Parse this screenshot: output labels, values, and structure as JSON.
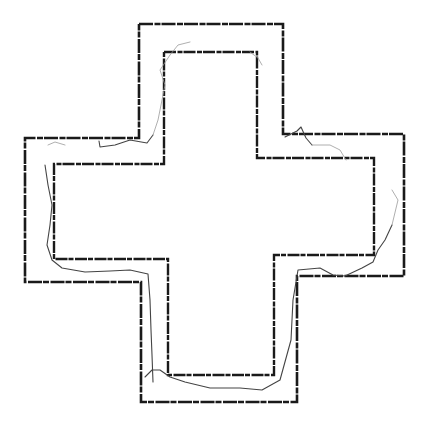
{
  "figure": {
    "background": "#ffffff",
    "wall_color": "#1a1a1a",
    "trace_color": "#444444",
    "faint_trace_color": "#9a9a9a",
    "outer_wall": [
      [
        139,
        24
      ],
      [
        283,
        24
      ],
      [
        283,
        134
      ],
      [
        404,
        134
      ],
      [
        404,
        276
      ],
      [
        297,
        276
      ],
      [
        297,
        402
      ],
      [
        141,
        402
      ],
      [
        141,
        282
      ],
      [
        25,
        282
      ],
      [
        25,
        138
      ],
      [
        139,
        138
      ],
      [
        139,
        24
      ]
    ],
    "inner_wall": [
      [
        164,
        52
      ],
      [
        257,
        52
      ],
      [
        257,
        158
      ],
      [
        374,
        158
      ],
      [
        374,
        255
      ],
      [
        274,
        255
      ],
      [
        274,
        375
      ],
      [
        168,
        375
      ],
      [
        168,
        259
      ],
      [
        54,
        259
      ],
      [
        54,
        164
      ],
      [
        164,
        164
      ],
      [
        164,
        52
      ]
    ],
    "trace_dark": [
      [
        [
          45,
          165
        ],
        [
          48,
          185
        ],
        [
          52,
          205
        ],
        [
          50,
          225
        ],
        [
          47,
          245
        ],
        [
          52,
          260
        ],
        [
          62,
          268
        ],
        [
          85,
          272
        ],
        [
          110,
          271
        ],
        [
          130,
          270
        ],
        [
          148,
          274
        ],
        [
          150,
          300
        ],
        [
          151,
          330
        ],
        [
          152,
          355
        ],
        [
          153,
          382
        ]
      ],
      [
        [
          145,
          377
        ],
        [
          152,
          370
        ],
        [
          160,
          370
        ],
        [
          170,
          377
        ],
        [
          185,
          382
        ],
        [
          210,
          388
        ],
        [
          240,
          388
        ],
        [
          262,
          390
        ],
        [
          280,
          380
        ],
        [
          291,
          340
        ],
        [
          293,
          300
        ],
        [
          298,
          270
        ],
        [
          320,
          268
        ],
        [
          333,
          275
        ],
        [
          345,
          276
        ],
        [
          362,
          268
        ],
        [
          373,
          262
        ],
        [
          378,
          250
        ],
        [
          385,
          240
        ],
        [
          392,
          225
        ]
      ],
      [
        [
          99,
          141
        ],
        [
          100,
          147
        ],
        [
          115,
          145
        ],
        [
          130,
          140
        ],
        [
          147,
          143
        ],
        [
          153,
          135
        ]
      ],
      [
        [
          285,
          137
        ],
        [
          297,
          131
        ],
        [
          301,
          127
        ],
        [
          306,
          138
        ],
        [
          312,
          145
        ]
      ]
    ],
    "trace_faint": [
      [
        [
          153,
          135
        ],
        [
          158,
          120
        ],
        [
          162,
          100
        ],
        [
          165,
          85
        ],
        [
          160,
          70
        ],
        [
          170,
          55
        ],
        [
          178,
          45
        ],
        [
          190,
          42
        ]
      ],
      [
        [
          312,
          145
        ],
        [
          330,
          145
        ],
        [
          340,
          150
        ],
        [
          346,
          160
        ]
      ],
      [
        [
          250,
          52
        ],
        [
          258,
          58
        ],
        [
          262,
          65
        ]
      ],
      [
        [
          48,
          145
        ],
        [
          55,
          142
        ],
        [
          65,
          145
        ]
      ],
      [
        [
          392,
          225
        ],
        [
          398,
          200
        ],
        [
          392,
          190
        ]
      ]
    ]
  }
}
